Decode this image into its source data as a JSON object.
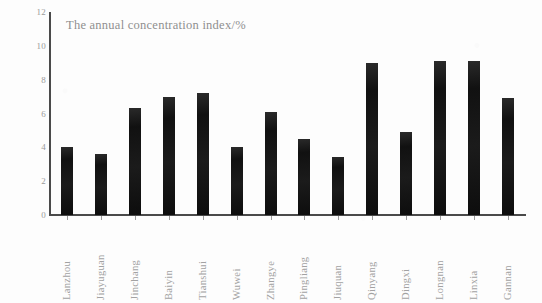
{
  "chart_data": {
    "type": "bar",
    "title": "The annual concentration index/%",
    "xlabel": "",
    "ylabel": "",
    "ylim": [
      0,
      12
    ],
    "yticks": [
      0,
      2,
      4,
      6,
      8,
      10,
      12
    ],
    "grid": false,
    "legend": null,
    "bar_color": "#141414",
    "axis_color": "#4a4a4a",
    "text_color": "#9a9a9a",
    "background": "#fdfdfd",
    "categories": [
      "Lanzhou",
      "Jiayuguan",
      "Jinchang",
      "Baiyin",
      "Tianshui",
      "Wuwei",
      "Zhangye",
      "Pingliang",
      "Jiuquan",
      "Qinyang",
      "Dingxi",
      "Longnan",
      "Linxia",
      "Gannan"
    ],
    "values": [
      4.0,
      3.6,
      6.3,
      7.0,
      7.2,
      4.0,
      6.1,
      4.5,
      3.4,
      9.0,
      4.9,
      9.1,
      9.1,
      6.9
    ]
  }
}
